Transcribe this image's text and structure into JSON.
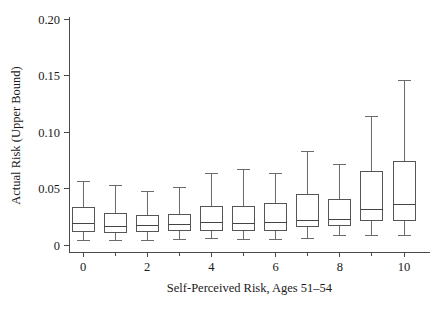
{
  "chart_data": {
    "type": "box",
    "title": "",
    "xlabel": "Self-Perceived Risk, Ages 51–54",
    "ylabel": "Actual Risk (Upper Bound)",
    "xlim": [
      -0.6,
      10.6
    ],
    "ylim": [
      0,
      0.205
    ],
    "grid": false,
    "legend": null,
    "x_tick_labels": [
      "0",
      "2",
      "4",
      "6",
      "8",
      "10"
    ],
    "x_tick_values": [
      0,
      2,
      4,
      6,
      8,
      10
    ],
    "x_minor_tick_values": [
      1,
      3,
      5,
      7,
      9
    ],
    "y_tick_labels": [
      "0",
      "0.05",
      "0.10",
      "0.15",
      "0.20"
    ],
    "y_tick_values": [
      0,
      0.05,
      0.1,
      0.15,
      0.2
    ],
    "categories": [
      "0",
      "1",
      "2",
      "3",
      "4",
      "5",
      "6",
      "7",
      "8",
      "9",
      "10"
    ],
    "boxes": [
      {
        "category": "0",
        "whisker_low": 0.004,
        "q1": 0.012,
        "median": 0.019,
        "q3": 0.033,
        "whisker_high": 0.056
      },
      {
        "category": "1",
        "whisker_low": 0.004,
        "q1": 0.011,
        "median": 0.016,
        "q3": 0.028,
        "whisker_high": 0.053
      },
      {
        "category": "2",
        "whisker_low": 0.004,
        "q1": 0.012,
        "median": 0.017,
        "q3": 0.026,
        "whisker_high": 0.047
      },
      {
        "category": "3",
        "whisker_low": 0.005,
        "q1": 0.013,
        "median": 0.018,
        "q3": 0.027,
        "whisker_high": 0.051
      },
      {
        "category": "4",
        "whisker_low": 0.006,
        "q1": 0.013,
        "median": 0.02,
        "q3": 0.034,
        "whisker_high": 0.063
      },
      {
        "category": "5",
        "whisker_low": 0.005,
        "q1": 0.013,
        "median": 0.019,
        "q3": 0.034,
        "whisker_high": 0.067
      },
      {
        "category": "6",
        "whisker_low": 0.005,
        "q1": 0.013,
        "median": 0.02,
        "q3": 0.037,
        "whisker_high": 0.063
      },
      {
        "category": "7",
        "whisker_low": 0.006,
        "q1": 0.016,
        "median": 0.022,
        "q3": 0.045,
        "whisker_high": 0.083
      },
      {
        "category": "8",
        "whisker_low": 0.008,
        "q1": 0.017,
        "median": 0.023,
        "q3": 0.04,
        "whisker_high": 0.071
      },
      {
        "category": "9",
        "whisker_low": 0.008,
        "q1": 0.022,
        "median": 0.031,
        "q3": 0.065,
        "whisker_high": 0.114
      },
      {
        "category": "10",
        "whisker_low": 0.008,
        "q1": 0.022,
        "median": 0.036,
        "q3": 0.074,
        "whisker_high": 0.146
      }
    ]
  },
  "axes": {
    "x_title": "Self-Perceived Risk, Ages 51–54",
    "y_title": "Actual Risk (Upper Bound)"
  },
  "colors": {
    "box_stroke": "#555555",
    "whisker_stroke": "#6b6b6b",
    "axis_stroke": "#4a4a4a",
    "text": "#1a1a1a",
    "background": "#ffffff"
  }
}
